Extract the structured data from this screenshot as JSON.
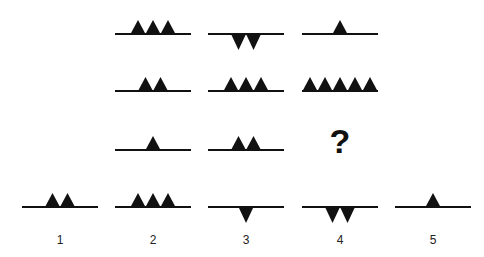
{
  "puzzle": {
    "matrix": [
      [
        {
          "up": 3,
          "down": 0
        },
        {
          "up": 0,
          "down": 2
        },
        {
          "up": 1,
          "down": 0
        }
      ],
      [
        {
          "up": 2,
          "down": 0
        },
        {
          "up": 3,
          "down": 0
        },
        {
          "up": 5,
          "down": 0
        }
      ],
      [
        {
          "up": 1,
          "down": 0
        },
        {
          "up": 2,
          "down": 0
        },
        {
          "missing": true,
          "symbol": "?"
        }
      ]
    ],
    "options": [
      {
        "label": "1",
        "up": 2,
        "down": 0
      },
      {
        "label": "2",
        "up": 3,
        "down": 0
      },
      {
        "label": "3",
        "up": 0,
        "down": 1
      },
      {
        "label": "4",
        "up": 0,
        "down": 2
      },
      {
        "label": "5",
        "up": 1,
        "down": 0
      }
    ]
  },
  "colors": {
    "shape": "#111111",
    "line": "#111111",
    "background": "#ffffff"
  }
}
